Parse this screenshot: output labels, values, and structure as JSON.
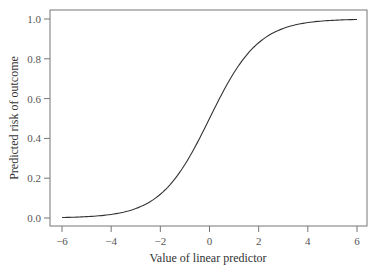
{
  "chart_data": {
    "type": "line",
    "title": "",
    "xlabel": "Value of linear predictor",
    "ylabel": "Predicted risk of outcome",
    "xlim": [
      -6,
      6
    ],
    "ylim": [
      0,
      1
    ],
    "x_ticks": [
      -6,
      -4,
      -2,
      0,
      2,
      4,
      6
    ],
    "x_tick_labels": [
      "−6",
      "−4",
      "−2",
      "0",
      "2",
      "4",
      "6"
    ],
    "y_ticks": [
      0.0,
      0.2,
      0.4,
      0.6,
      0.8,
      1.0
    ],
    "y_tick_labels": [
      "0.0",
      "0.2",
      "0.4",
      "0.6",
      "0.8",
      "1.0"
    ],
    "grid": false,
    "legend": null,
    "series": [
      {
        "name": "logistic",
        "function": "1/(1+exp(-x))",
        "x": [
          -6,
          -5,
          -4,
          -3,
          -2,
          -1,
          0,
          1,
          2,
          3,
          4,
          5,
          6
        ],
        "values": [
          0.002,
          0.007,
          0.018,
          0.047,
          0.119,
          0.269,
          0.5,
          0.731,
          0.881,
          0.953,
          0.982,
          0.993,
          0.998
        ],
        "color": "#333333"
      }
    ]
  },
  "style": {
    "axis_color": "#666666",
    "line_color": "#333333"
  }
}
